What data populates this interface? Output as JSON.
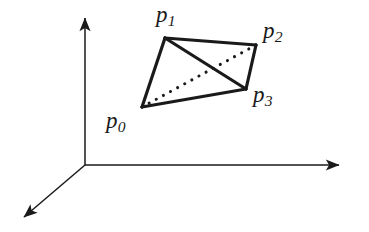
{
  "figure": {
    "name": "tetrahedron-in-3d-axes",
    "background_color": "#ffffff",
    "stroke_color": "#1a1a1a",
    "width": 369,
    "height": 232
  },
  "axes": {
    "origin": [
      85,
      165
    ],
    "y_axis": {
      "name": "y-axis",
      "from": [
        85,
        165
      ],
      "to": [
        85,
        12
      ],
      "arrow": "end"
    },
    "x_axis": {
      "name": "x-axis",
      "from": [
        85,
        165
      ],
      "to": [
        345,
        165
      ],
      "arrow": "end"
    },
    "z_axis": {
      "name": "z-axis",
      "from": [
        85,
        165
      ],
      "to": [
        19,
        221
      ],
      "arrow": "end"
    },
    "tick_labels": [],
    "axis_titles": []
  },
  "vertices": [
    {
      "id": "p0",
      "label": "p",
      "subscript": "0",
      "point": [
        142,
        107
      ]
    },
    {
      "id": "p1",
      "label": "p",
      "subscript": "1",
      "point": [
        165,
        38
      ]
    },
    {
      "id": "p2",
      "label": "p",
      "subscript": "2",
      "point": [
        256,
        45
      ]
    },
    {
      "id": "p3",
      "label": "p",
      "subscript": "3",
      "point": [
        246,
        89
      ]
    }
  ],
  "edges": [
    {
      "id": "p0-p1",
      "from": "p0",
      "to": "p1",
      "style": "solid",
      "hidden": false
    },
    {
      "id": "p1-p2",
      "from": "p1",
      "to": "p2",
      "style": "solid",
      "hidden": false
    },
    {
      "id": "p2-p3",
      "from": "p2",
      "to": "p3",
      "style": "solid",
      "hidden": false
    },
    {
      "id": "p3-p0",
      "from": "p3",
      "to": "p0",
      "style": "solid",
      "hidden": false
    },
    {
      "id": "p1-p3",
      "from": "p1",
      "to": "p3",
      "style": "solid",
      "hidden": false
    },
    {
      "id": "p0-p2",
      "from": "p0",
      "to": "p2",
      "style": "dotted",
      "hidden": true
    }
  ]
}
